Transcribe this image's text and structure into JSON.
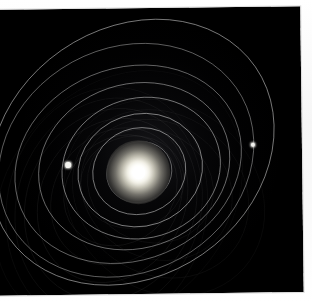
{
  "app": {
    "title": "Orbital Simulation Viewer",
    "canvas_name": "orbit-canvas",
    "background_color": "#000000",
    "page_background_color": "#ffffff"
  },
  "scene": {
    "type": "n-body orbital plot",
    "center_body": {
      "name": "star",
      "label": "Sun",
      "color": "#ffffff",
      "glow_color": "#fffff5",
      "x": 138,
      "y": 172,
      "core_radius": 6
    },
    "view": {
      "center_x": 138,
      "center_y": 172,
      "canvas_width": 306,
      "canvas_height": 286,
      "rotation_deg": -0.7
    }
  },
  "chart_data": {
    "type": "scatter",
    "xlabel": "",
    "ylabel": "",
    "grid": false,
    "legend": "none",
    "center": {
      "x": 138,
      "y": 172
    },
    "orbits": [
      {
        "id": "orbit-1",
        "rx": 22,
        "ry": 20,
        "rot": -24,
        "cx": 138,
        "cy": 172,
        "opacity": 0.5,
        "width": 0.7,
        "color": "#cfcfcf"
      },
      {
        "id": "orbit-2",
        "rx": 33,
        "ry": 30,
        "rot": -22,
        "cx": 139,
        "cy": 172,
        "opacity": 0.55,
        "width": 0.7,
        "color": "#d6d6d6"
      },
      {
        "id": "orbit-3",
        "rx": 47,
        "ry": 43,
        "rot": -20,
        "cx": 139,
        "cy": 171,
        "opacity": 0.6,
        "width": 0.8,
        "color": "#dcdcdc"
      },
      {
        "id": "orbit-4",
        "rx": 63,
        "ry": 56,
        "rot": -18,
        "cx": 140,
        "cy": 170,
        "opacity": 0.62,
        "width": 0.8,
        "color": "#e0e0e0"
      },
      {
        "id": "orbit-5",
        "rx": 80,
        "ry": 70,
        "rot": -16,
        "cx": 141,
        "cy": 168,
        "opacity": 0.58,
        "width": 0.8,
        "color": "#dedede"
      },
      {
        "id": "orbit-6",
        "rx": 97,
        "ry": 82,
        "rot": -18,
        "cx": 134,
        "cy": 166,
        "opacity": 0.55,
        "width": 0.8,
        "color": "#d8d8d8"
      },
      {
        "id": "orbit-7",
        "rx": 116,
        "ry": 96,
        "rot": -22,
        "cx": 128,
        "cy": 164,
        "opacity": 0.52,
        "width": 0.8,
        "color": "#d4d4d4"
      },
      {
        "id": "orbit-8",
        "rx": 132,
        "ry": 112,
        "rot": -28,
        "cx": 126,
        "cy": 160,
        "opacity": 0.5,
        "width": 0.8,
        "color": "#d0d0d0"
      },
      {
        "id": "orbit-9",
        "rx": 150,
        "ry": 124,
        "rot": -34,
        "cx": 132,
        "cy": 152,
        "opacity": 0.55,
        "width": 0.9,
        "color": "#dadada"
      }
    ],
    "faint_arcs": [
      {
        "id": "arc-1",
        "rx": 60,
        "ry": 52,
        "rot": -40,
        "cx": 120,
        "cy": 190,
        "opacity": 0.16,
        "width": 0.6,
        "color": "#9a9a9a"
      },
      {
        "id": "arc-2",
        "rx": 72,
        "ry": 62,
        "rot": -52,
        "cx": 116,
        "cy": 196,
        "opacity": 0.15,
        "width": 0.6,
        "color": "#979797"
      },
      {
        "id": "arc-3",
        "rx": 85,
        "ry": 72,
        "rot": -60,
        "cx": 112,
        "cy": 200,
        "opacity": 0.15,
        "width": 0.6,
        "color": "#949494"
      },
      {
        "id": "arc-4",
        "rx": 98,
        "ry": 84,
        "rot": -66,
        "cx": 110,
        "cy": 204,
        "opacity": 0.14,
        "width": 0.6,
        "color": "#919191"
      },
      {
        "id": "arc-5",
        "rx": 110,
        "ry": 92,
        "rot": -72,
        "cx": 108,
        "cy": 206,
        "opacity": 0.13,
        "width": 0.6,
        "color": "#8d8d8d"
      },
      {
        "id": "arc-6",
        "rx": 122,
        "ry": 100,
        "rot": -78,
        "cx": 106,
        "cy": 208,
        "opacity": 0.12,
        "width": 0.6,
        "color": "#8a8a8a"
      },
      {
        "id": "arc-7",
        "rx": 64,
        "ry": 56,
        "rot": 22,
        "cx": 150,
        "cy": 186,
        "opacity": 0.14,
        "width": 0.6,
        "color": "#8f8f8f"
      },
      {
        "id": "arc-8",
        "rx": 78,
        "ry": 68,
        "rot": 30,
        "cx": 156,
        "cy": 190,
        "opacity": 0.13,
        "width": 0.6,
        "color": "#8c8c8c"
      },
      {
        "id": "arc-9",
        "rx": 92,
        "ry": 80,
        "rot": 36,
        "cx": 160,
        "cy": 194,
        "opacity": 0.12,
        "width": 0.6,
        "color": "#898989"
      },
      {
        "id": "arc-10",
        "rx": 106,
        "ry": 92,
        "rot": 42,
        "cx": 164,
        "cy": 198,
        "opacity": 0.11,
        "width": 0.6,
        "color": "#868686"
      },
      {
        "id": "arc-11",
        "rx": 52,
        "ry": 46,
        "rot": -10,
        "cx": 132,
        "cy": 182,
        "opacity": 0.14,
        "width": 0.6,
        "color": "#8f8f8f"
      },
      {
        "id": "arc-12",
        "rx": 140,
        "ry": 110,
        "rot": -48,
        "cx": 118,
        "cy": 198,
        "opacity": 0.1,
        "width": 0.6,
        "color": "#7f7f7f"
      }
    ],
    "planets": [
      {
        "id": "planet-left",
        "label": "body A",
        "x": 68,
        "y": 164,
        "size": 2.6,
        "color": "#f4f4f0"
      },
      {
        "id": "planet-right",
        "label": "body B",
        "x": 253,
        "y": 146,
        "size": 2.4,
        "color": "#f2f2ee"
      }
    ]
  }
}
